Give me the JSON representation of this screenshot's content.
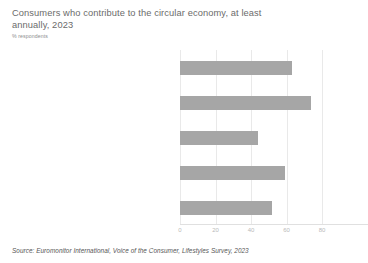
{
  "header": {
    "title": "Consumers who contribute to the circular economy, at least annually, 2023",
    "subtitle": "% respondents"
  },
  "source": {
    "text": "Source: Euromonitor International, Voice of the Consumer, Lifestyles Survey, 2023"
  },
  "colors": {
    "bar": "#a6a6a6",
    "grid": "#e9e9e9",
    "title_text": "#6b6b6b",
    "label_text": "#8d8d8d"
  },
  "chart_data": {
    "type": "bar",
    "orientation": "horizontal",
    "title": "Consumers who contribute to the circular economy, at least annually, 2023",
    "subtitle": "% respondents",
    "xlabel": "",
    "ylabel": "",
    "xlim": [
      0,
      80
    ],
    "xticks": [
      0,
      20,
      40,
      60,
      80
    ],
    "xticklabels": [
      "0",
      "20",
      "40",
      "60",
      "80"
    ],
    "grid": true,
    "legend": false,
    "categories": [
      "Buy used or second-hand items",
      "Donate used items to a charity or non-profit",
      "Rent items, rather than buy",
      "Sell used or second-hand items",
      "Share/swap items or services"
    ],
    "values": [
      63,
      74,
      44,
      59,
      52
    ]
  }
}
